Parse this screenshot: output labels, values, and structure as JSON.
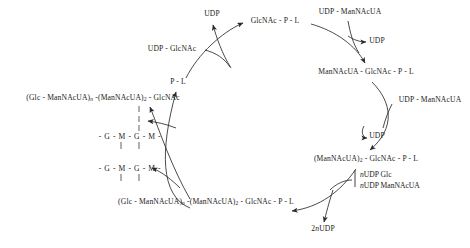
{
  "diagram": {
    "type": "cyclic-pathway",
    "background_color": "#ffffff",
    "stroke_color": "#2b2b2b",
    "cycle_nodes": [
      {
        "id": "p-l",
        "text": "P - L",
        "x": 178,
        "y": 83
      },
      {
        "id": "glcnac-p-l",
        "text": "GlcNAc - P - L",
        "x": 275,
        "y": 22
      },
      {
        "id": "man-glcnac",
        "text": "ManNAcUA - GlcNAc - P - L",
        "x": 366,
        "y": 73
      },
      {
        "id": "man2-glcnac",
        "text": "(ManNAcUA)2 - GlcNAc - P - L",
        "x": 366,
        "y": 160
      },
      {
        "id": "polymer-p-l",
        "text": "(Glc - ManNAcUA)n -(ManNAcUA)2 - GlcNAc - P - L",
        "x": 206,
        "y": 203
      },
      {
        "id": "polymer-free",
        "text": "(Glc - ManNAcUA)n -(ManNAcUA)2 - GlcNAc",
        "x": 103,
        "y": 99
      }
    ],
    "substrates": [
      {
        "id": "udp-glcnac-in",
        "text": "UDP - GlcNAc",
        "x": 172,
        "y": 50
      },
      {
        "id": "udp-man-in-1",
        "text": "UDP - ManNAcUA",
        "x": 350,
        "y": 13
      },
      {
        "id": "udp-man-in-2",
        "text": "UDP - ManNAcUA",
        "x": 430,
        "y": 101
      }
    ],
    "products": [
      {
        "id": "udp-out-top",
        "text": "UDP",
        "x": 212,
        "y": 15
      },
      {
        "id": "udp-out-r1",
        "text": "UDP",
        "x": 375,
        "y": 42
      },
      {
        "id": "udp-out-r2",
        "text": "UDP",
        "x": 375,
        "y": 137
      },
      {
        "id": "udp-out-bot",
        "text": "2nUDP",
        "x": 323,
        "y": 230
      }
    ],
    "bracket_substrates": {
      "id": "n-udp-donors",
      "x": 358,
      "y": 176,
      "lines": [
        "nUDP Glc",
        "nUDP ManNAcUA"
      ]
    },
    "chain_rows": [
      {
        "id": "peptidoglycan-chain-upper",
        "text": "- G - M - G - M -",
        "x": 121,
        "y": 137
      },
      {
        "id": "peptidoglycan-chain-lower",
        "text": "- G - M - G - M -",
        "x": 121,
        "y": 169
      }
    ]
  }
}
